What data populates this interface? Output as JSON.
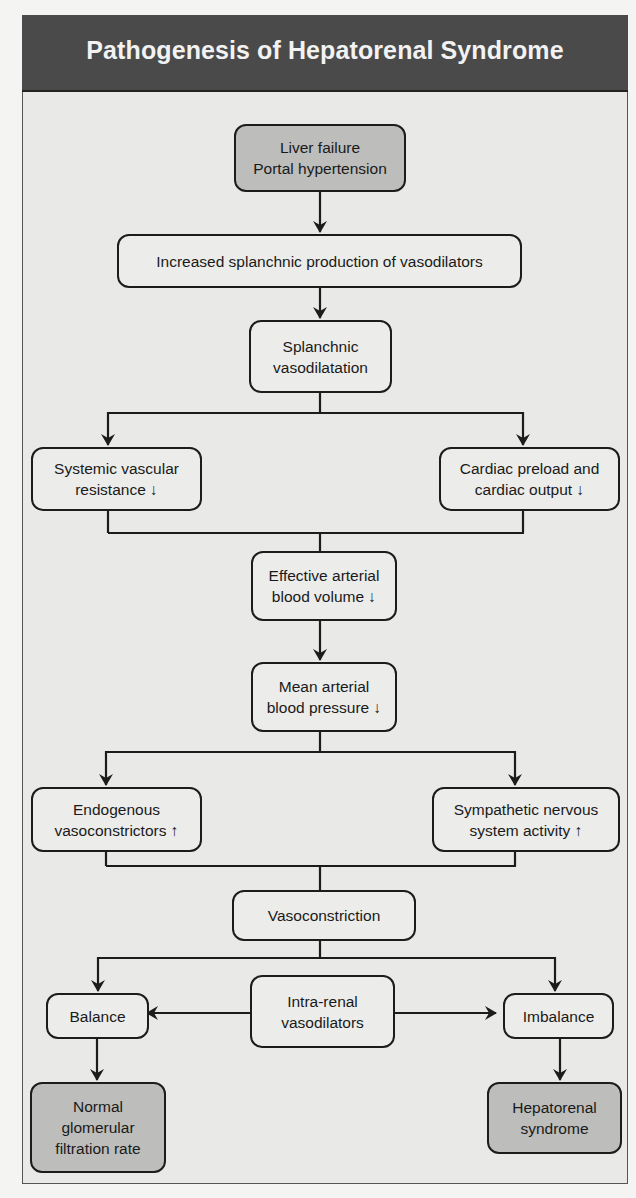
{
  "header": {
    "title": "Pathogenesis of Hepatorenal Syndrome"
  },
  "colors": {
    "header_bg": "#4a4a4a",
    "panel_bg": "#e9e9e7",
    "terminal_box": "#bdbdbb",
    "box": "#ececea",
    "stroke": "#1c1c1c"
  },
  "nodes": {
    "liver_failure": "Liver failure\nPortal hypertension",
    "vasodilator_production": "Increased splanchnic production of vasodilators",
    "splanchnic_vasodilatation": "Splanchnic\nvasodilatation",
    "systemic_vascular_resistance": "Systemic vascular\nresistance ↓",
    "cardiac_preload": "Cardiac preload and\ncardiac output ↓",
    "effective_arterial_volume": "Effective arterial\nblood volume ↓",
    "mean_arterial_pressure": "Mean arterial\nblood pressure ↓",
    "endogenous_vasoconstrictors": "Endogenous\nvasoconstrictors ↑",
    "sympathetic_activity": "Sympathetic nervous\nsystem activity ↑",
    "vasoconstriction": "Vasoconstriction",
    "balance": "Balance",
    "intra_renal_vasodilators": "Intra-renal\nvasodilators",
    "imbalance": "Imbalance",
    "normal_gfr": "Normal\nglomerular\nfiltration rate",
    "hepatorenal_syndrome": "Hepatorenal\nsyndrome"
  },
  "edges": [
    [
      "liver_failure",
      "vasodilator_production"
    ],
    [
      "vasodilator_production",
      "splanchnic_vasodilatation"
    ],
    [
      "splanchnic_vasodilatation",
      "systemic_vascular_resistance"
    ],
    [
      "splanchnic_vasodilatation",
      "cardiac_preload"
    ],
    [
      "systemic_vascular_resistance",
      "effective_arterial_volume"
    ],
    [
      "cardiac_preload",
      "effective_arterial_volume"
    ],
    [
      "effective_arterial_volume",
      "mean_arterial_pressure"
    ],
    [
      "mean_arterial_pressure",
      "endogenous_vasoconstrictors"
    ],
    [
      "mean_arterial_pressure",
      "sympathetic_activity"
    ],
    [
      "endogenous_vasoconstrictors",
      "vasoconstriction"
    ],
    [
      "sympathetic_activity",
      "vasoconstriction"
    ],
    [
      "vasoconstriction",
      "balance"
    ],
    [
      "vasoconstriction",
      "imbalance"
    ],
    [
      "intra_renal_vasodilators",
      "balance"
    ],
    [
      "intra_renal_vasodilators",
      "imbalance"
    ],
    [
      "balance",
      "normal_gfr"
    ],
    [
      "imbalance",
      "hepatorenal_syndrome"
    ]
  ]
}
